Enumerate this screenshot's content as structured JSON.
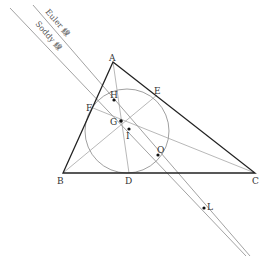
{
  "diagram": {
    "type": "geometry",
    "line_labels": {
      "euler": "Euler 線",
      "soddy": "Soddy 線"
    },
    "vertices": {
      "A": "A",
      "B": "B",
      "C": "C"
    },
    "tangent_points": {
      "D": "D",
      "E": "E",
      "F": "F"
    },
    "special_points": {
      "H": "H",
      "G": "G",
      "I": "I",
      "O": "O",
      "L": "L"
    },
    "colors": {
      "triangle": "#222222",
      "thin_lines": "#888888",
      "circle": "#777777",
      "points": "#111111"
    }
  }
}
